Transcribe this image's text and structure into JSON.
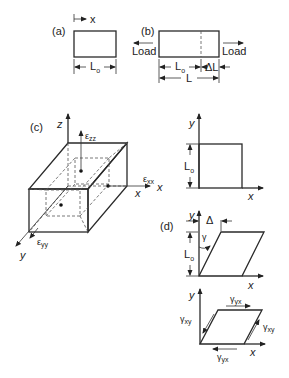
{
  "panel_a": {
    "label": "(a)",
    "axis_label": "x",
    "length_label": "L",
    "length_sub": "o"
  },
  "panel_b": {
    "label": "(b)",
    "load_left": "Load",
    "load_right": "Load",
    "orig_length_label": "L",
    "orig_length_sub": "o",
    "delta_label": "ΔL",
    "total_length_label": "L"
  },
  "panel_c": {
    "label": "(c)",
    "axis_z": "z",
    "axis_x": "x",
    "axis_y": "y",
    "strain_zz": "ε",
    "strain_zz_sub": "zz",
    "strain_xx": "ε",
    "strain_xx_sub": "xx",
    "strain_yy": "ε",
    "strain_yy_sub": "yy"
  },
  "panel_square": {
    "axis_y": "y",
    "axis_x": "x",
    "length_label": "L",
    "length_sub": "o"
  },
  "panel_d": {
    "label": "(d)",
    "axis_y": "y",
    "axis_x": "x",
    "delta_label": "Δ",
    "gamma_label": "γ",
    "length_label": "L",
    "length_sub": "o"
  },
  "panel_shear": {
    "axis_y": "y",
    "axis_x": "x",
    "gamma_yx_top": "γ",
    "gamma_yx_top_sub": "yx",
    "gamma_yx_bottom": "γ",
    "gamma_yx_bottom_sub": "yx",
    "gamma_xy_left": "γ",
    "gamma_xy_left_sub": "xy",
    "gamma_xy_right": "γ",
    "gamma_xy_right_sub": "xy"
  }
}
